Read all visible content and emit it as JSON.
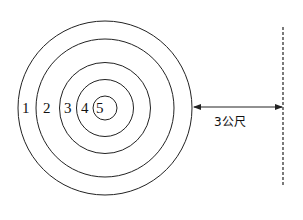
{
  "diagram": {
    "type": "target-rings",
    "rings": [
      {
        "label": "1",
        "radius": 87
      },
      {
        "label": "2",
        "radius": 69
      },
      {
        "label": "3",
        "radius": 45.5
      },
      {
        "label": "4",
        "radius": 28.5
      },
      {
        "label": "5",
        "radius": 12
      }
    ],
    "distance_label": "3公尺",
    "line_style": "dashed",
    "stroke_color": "#222222"
  }
}
